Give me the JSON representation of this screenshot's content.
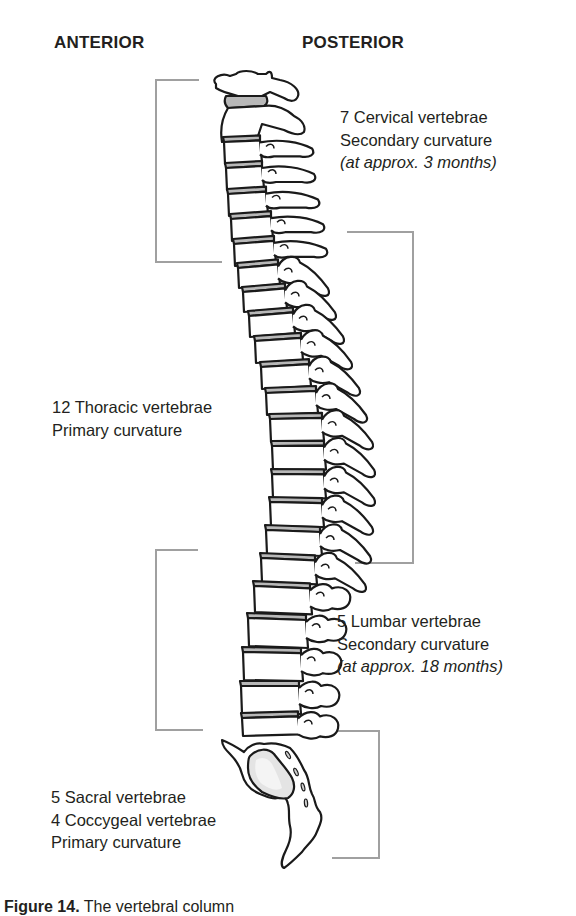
{
  "headings": {
    "anterior": "ANTERIOR",
    "posterior": "POSTERIOR"
  },
  "regions": {
    "cervical": {
      "line1": "7 Cervical vertebrae",
      "line2": "Secondary curvature",
      "line3": "(at approx. 3 months)"
    },
    "thoracic": {
      "line1": "12 Thoracic vertebrae",
      "line2": "Primary curvature"
    },
    "lumbar": {
      "line1": "5 Lumbar vertebrae",
      "line2": "Secondary curvature",
      "line3": "(at approx. 18 months)"
    },
    "sacral": {
      "line1": "5 Sacral vertebrae",
      "line2": "4 Coccygeal vertebrae",
      "line3": "Primary curvature"
    }
  },
  "caption": {
    "label": "Figure 14.",
    "text": "The vertebral column"
  },
  "colors": {
    "outline": "#1a1a1a",
    "disc": "#b8b8b8",
    "bracket": "#a0a0a0",
    "sacrum_shade": "#d9d9d9"
  }
}
